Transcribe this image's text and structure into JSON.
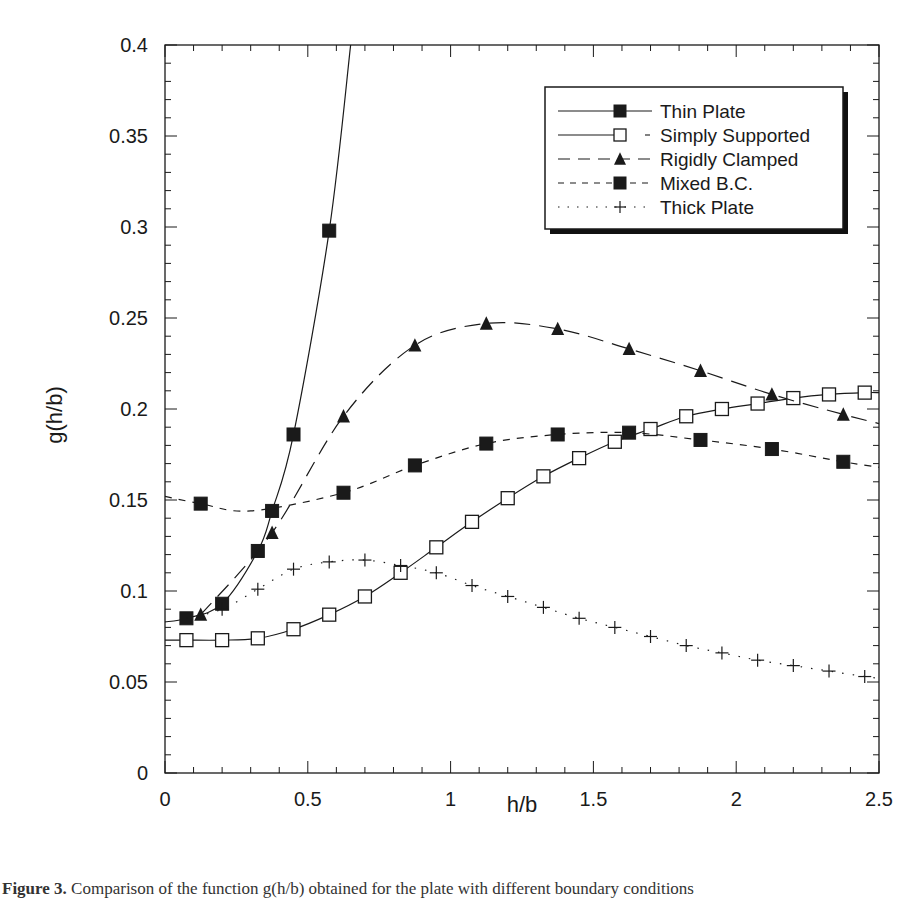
{
  "chart_data": {
    "type": "line",
    "title": "",
    "xlabel": "h/b",
    "ylabel": "g(h/b)",
    "xlim": [
      0,
      2.5
    ],
    "ylim": [
      0,
      0.4
    ],
    "x_ticks": [
      0,
      0.5,
      1,
      1.5,
      2,
      2.5
    ],
    "x_tick_labels": [
      "0",
      "0.5",
      "1",
      "1.5",
      "2",
      "2.5"
    ],
    "y_ticks": [
      0,
      0.05,
      0.1,
      0.15,
      0.2,
      0.25,
      0.3,
      0.35,
      0.4
    ],
    "y_tick_labels": [
      "0",
      "0.05",
      "0.1",
      "0.15",
      "0.2",
      "0.25",
      "0.3",
      "0.35",
      "0.4"
    ],
    "grid": false,
    "legend_position": "upper right (inside, boxed with drop shadow)",
    "series": [
      {
        "name": "Thin Plate",
        "marker": "filled-square",
        "line": "solid",
        "x": [
          0.075,
          0.2,
          0.325,
          0.375,
          0.45,
          0.575
        ],
        "y": [
          0.085,
          0.093,
          0.122,
          0.144,
          0.186,
          0.298
        ],
        "curve_extends_to": [
          0.65,
          0.4
        ]
      },
      {
        "name": "Simply Supported",
        "marker": "open-square",
        "line": "solid (broken segments)",
        "x": [
          0.075,
          0.2,
          0.325,
          0.45,
          0.575,
          0.7,
          0.825,
          0.95,
          1.075,
          1.2,
          1.325,
          1.45,
          1.575,
          1.7,
          1.825,
          1.95,
          2.075,
          2.2,
          2.325,
          2.45
        ],
        "y": [
          0.073,
          0.073,
          0.074,
          0.079,
          0.087,
          0.097,
          0.11,
          0.124,
          0.138,
          0.151,
          0.163,
          0.173,
          0.182,
          0.189,
          0.196,
          0.2,
          0.203,
          0.206,
          0.208,
          0.209
        ]
      },
      {
        "name": "Rigidly Clamped",
        "marker": "filled-triangle",
        "line": "long-dash",
        "x": [
          0.125,
          0.375,
          0.625,
          0.875,
          1.125,
          1.375,
          1.625,
          1.875,
          2.125,
          2.375
        ],
        "y": [
          0.087,
          0.132,
          0.196,
          0.235,
          0.247,
          0.244,
          0.233,
          0.221,
          0.208,
          0.197
        ]
      },
      {
        "name": "Mixed B.C.",
        "marker": "filled-square",
        "line": "short-dash",
        "x": [
          0.125,
          0.625,
          0.875,
          1.125,
          1.375,
          1.625,
          1.875,
          2.125,
          2.375
        ],
        "y": [
          0.148,
          0.154,
          0.169,
          0.181,
          0.186,
          0.187,
          0.183,
          0.178,
          0.171
        ],
        "curve_min": [
          0.3,
          0.144
        ]
      },
      {
        "name": "Thick Plate",
        "marker": "plus",
        "line": "dotted",
        "x": [
          0.2,
          0.325,
          0.45,
          0.575,
          0.7,
          0.825,
          0.95,
          1.075,
          1.2,
          1.325,
          1.45,
          1.575,
          1.7,
          1.825,
          1.95,
          2.075,
          2.2,
          2.325,
          2.45
        ],
        "y": [
          0.09,
          0.101,
          0.112,
          0.116,
          0.117,
          0.114,
          0.11,
          0.103,
          0.097,
          0.091,
          0.085,
          0.08,
          0.075,
          0.07,
          0.066,
          0.062,
          0.059,
          0.056,
          0.053
        ]
      }
    ]
  },
  "legend": {
    "items": [
      {
        "label": "Thin Plate"
      },
      {
        "label": "Simply Supported"
      },
      {
        "label": "Rigidly Clamped"
      },
      {
        "label": "Mixed B.C."
      },
      {
        "label": "Thick Plate"
      }
    ]
  },
  "caption": {
    "label": "Figure 3.",
    "text": "Comparison of the function g(h/b) obtained for the plate with different boundary conditions"
  },
  "colors": {
    "ink": "#1a1a1a",
    "background": "#ffffff",
    "legend_shadow": "#111111"
  }
}
